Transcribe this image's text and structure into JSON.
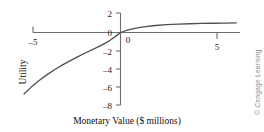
{
  "chart_data": {
    "type": "line",
    "title": "",
    "subtitle": "",
    "xlabel": "Monetary Value ($ millions)",
    "ylabel": "Utility",
    "xlim": [
      -5.6,
      6.3
    ],
    "ylim": [
      -8.3,
      2.2
    ],
    "xticks": [
      -5,
      0,
      5
    ],
    "xticklabels": [
      "–5",
      "0",
      "5"
    ],
    "yticks": [
      2,
      0,
      -2,
      -4,
      -6,
      -8
    ],
    "yticklabels": [
      "2",
      "0",
      "–2",
      "–4",
      "–6",
      "–8"
    ],
    "grid": false,
    "legend": null,
    "series": [
      {
        "name": "Utility function",
        "x": [
          -5.0,
          -4.6,
          -4.2,
          -3.8,
          -3.4,
          -3.0,
          -2.6,
          -2.2,
          -1.8,
          -1.4,
          -1.0,
          -0.6,
          -0.2,
          0.0,
          0.4,
          0.8,
          1.2,
          1.8,
          2.4,
          3.0,
          3.6,
          4.2,
          4.8,
          5.4,
          6.0
        ],
        "y": [
          -6.3,
          -5.55,
          -4.9,
          -4.32,
          -3.8,
          -3.32,
          -2.88,
          -2.48,
          -2.08,
          -1.7,
          -1.32,
          -0.88,
          -0.32,
          0.0,
          0.28,
          0.46,
          0.58,
          0.72,
          0.8,
          0.86,
          0.9,
          0.93,
          0.95,
          0.97,
          0.99
        ]
      }
    ],
    "annotations": [],
    "credit": "© Cengage Learning",
    "colors": {
      "curve": "#4f4f4f",
      "axis": "#6e6e6e",
      "text": "#1a1a1a",
      "credit": "#8c8c8c"
    }
  },
  "labels": {
    "xaxis_title": "Monetary Value ($ millions)",
    "yaxis_title": "Utility",
    "x_tick_minus5": "–5",
    "x_tick_zero": "0",
    "x_tick_five": "5",
    "y_tick_2": "2",
    "y_tick_0": "0",
    "y_tick_m2": "–2",
    "y_tick_m4": "–4",
    "y_tick_m6": "–6",
    "y_tick_m8": "–8",
    "credit": "© Cengage Learning"
  }
}
